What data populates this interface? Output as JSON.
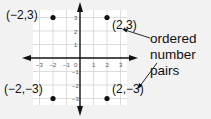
{
  "diagram": {
    "type": "coordinate-plane",
    "x_ticks": [
      "-3",
      "-2",
      "-1",
      "0",
      "1",
      "2",
      "3"
    ],
    "y_ticks": [
      "3",
      "2",
      "1",
      "-1",
      "-2",
      "-3"
    ],
    "points": [
      {
        "label": "(−2,3)",
        "x": -2,
        "y": 3
      },
      {
        "label": "(2,3)",
        "x": 2,
        "y": 3
      },
      {
        "label": "(−2,−3)",
        "x": -2,
        "y": -3
      },
      {
        "label": "(2,−3)",
        "x": 2,
        "y": -3
      }
    ],
    "annotation": {
      "lines": [
        "ordered",
        "number",
        "pairs"
      ]
    },
    "colors": {
      "background": "#f2f2f2",
      "grid_bg": "#ffffff",
      "grid_line": "#d0d0d0",
      "axis": "#111111"
    }
  }
}
